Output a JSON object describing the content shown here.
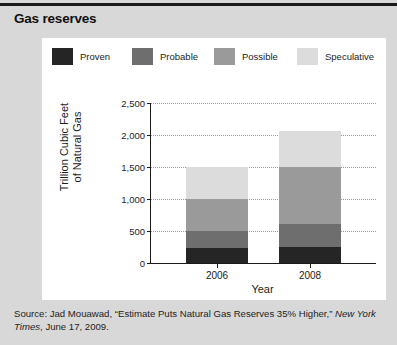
{
  "figure": {
    "title": "Gas reserves",
    "panel_bg": "#ffffff",
    "figure_bg": "#d8d8d8"
  },
  "source": {
    "prefix": "Source: Jad Mouawad, “Estimate Puts Natural Gas Reserves 35% Higher,” ",
    "publication": "New York Times",
    "suffix": ", June 17, 2009."
  },
  "chart_data": {
    "type": "bar",
    "stacked": true,
    "title": "Gas reserves",
    "xlabel": "Year",
    "ylabel": "Trillion Cubic Feet of Natural Gas",
    "ylabel_line1": "Trillion Cubic Feet",
    "ylabel_line2": "of Natural Gas",
    "categories": [
      "2006",
      "2008"
    ],
    "ylim": [
      0,
      2500
    ],
    "yticks": [
      0,
      500,
      1000,
      1500,
      2000,
      2500
    ],
    "ytick_labels": [
      "0",
      "500",
      "1,000",
      "1,500",
      "2,000",
      "2,500"
    ],
    "grid": true,
    "legend_position": "top",
    "series": [
      {
        "name": "Proven",
        "color": "#252525",
        "values": [
          240,
          250
        ]
      },
      {
        "name": "Probable",
        "color": "#6e6e6e",
        "values": [
          260,
          360
        ]
      },
      {
        "name": "Possible",
        "color": "#9a9a9a",
        "values": [
          500,
          890
        ]
      },
      {
        "name": "Speculative",
        "color": "#dcdcdc",
        "values": [
          500,
          560
        ]
      }
    ],
    "totals": [
      1500,
      2060
    ]
  }
}
